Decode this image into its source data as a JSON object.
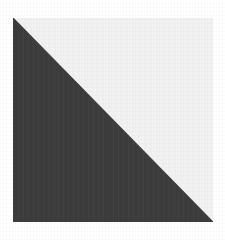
{
  "figure": {
    "canvas": {
      "width_px": 225,
      "height_px": 240,
      "background_color": "#ffffff"
    },
    "square": {
      "label": "square-outline",
      "left_px": 13,
      "top_px": 18,
      "width_px": 200,
      "height_px": 204,
      "stroke_color": "#c8c8c8",
      "stroke_width_px": 0
    },
    "regions": [
      {
        "name": "lower-left-triangle",
        "label": "Dark half",
        "fill_color": "#3c3c3c",
        "vertices": "top-left, bottom-left, bottom-right",
        "area_fraction": 0.5
      },
      {
        "name": "upper-right-triangle",
        "label": "Light half",
        "fill_color": "#f2f2f2",
        "vertices": "top-left, top-right, bottom-right",
        "area_fraction": 0.5
      }
    ],
    "diagonal": {
      "name": "hypotenuse",
      "from": "top-left",
      "to": "bottom-right",
      "color": "#3c3c3c"
    }
  }
}
